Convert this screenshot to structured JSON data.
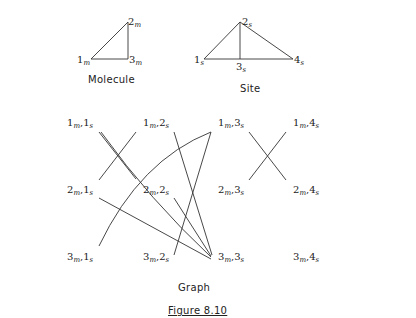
{
  "molecule": {
    "caption": "Molecule",
    "nodes": [
      {
        "id": "1",
        "sub": "m"
      },
      {
        "id": "2",
        "sub": "m"
      },
      {
        "id": "3",
        "sub": "m"
      }
    ],
    "edges": [
      [
        "1",
        "2"
      ],
      [
        "2",
        "3"
      ],
      [
        "1",
        "3"
      ]
    ]
  },
  "site": {
    "caption": "Site",
    "nodes": [
      {
        "id": "1",
        "sub": "s"
      },
      {
        "id": "2",
        "sub": "s"
      },
      {
        "id": "3",
        "sub": "s"
      },
      {
        "id": "4",
        "sub": "s"
      }
    ],
    "edges": [
      [
        "1",
        "2"
      ],
      [
        "2",
        "3"
      ],
      [
        "2",
        "4"
      ],
      [
        "1",
        "4"
      ]
    ]
  },
  "graph": {
    "caption": "Graph",
    "nodes": [
      {
        "m": "1",
        "s": "1"
      },
      {
        "m": "1",
        "s": "2"
      },
      {
        "m": "1",
        "s": "3"
      },
      {
        "m": "1",
        "s": "4"
      },
      {
        "m": "2",
        "s": "1"
      },
      {
        "m": "2",
        "s": "2"
      },
      {
        "m": "2",
        "s": "3"
      },
      {
        "m": "2",
        "s": "4"
      },
      {
        "m": "3",
        "s": "1"
      },
      {
        "m": "3",
        "s": "2"
      },
      {
        "m": "3",
        "s": "3"
      },
      {
        "m": "3",
        "s": "4"
      }
    ],
    "edges": [
      [
        "1m,1s",
        "2m,2s"
      ],
      [
        "1m,1s",
        "3m,3s"
      ],
      [
        "1m,2s",
        "2m,1s"
      ],
      [
        "1m,2s",
        "3m,3s"
      ],
      [
        "2m,1s",
        "3m,3s"
      ],
      [
        "2m,2s",
        "3m,3s"
      ],
      [
        "3m,1s",
        "1m,3s"
      ],
      [
        "3m,2s",
        "1m,3s"
      ],
      [
        "1m,3s",
        "2m,4s"
      ],
      [
        "1m,4s",
        "2m,3s"
      ]
    ]
  },
  "figure_label": "Figure 8.10"
}
